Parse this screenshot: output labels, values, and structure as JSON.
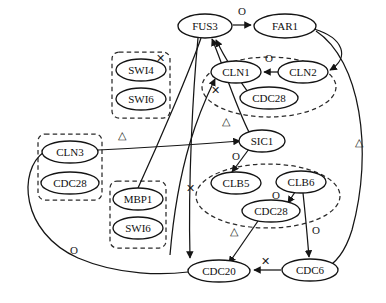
{
  "diagram": {
    "type": "directed-graph",
    "width": 386,
    "height": 303,
    "background": "#ffffff",
    "node_fill": "#ffffff",
    "node_stroke": "#141414",
    "group_stroke": "#2a2a2a",
    "edge_stroke": "#151515"
  },
  "nodes": [
    {
      "id": "FUS3",
      "label": "FUS3",
      "cx": 205,
      "cy": 26,
      "rx": 27,
      "ry": 12
    },
    {
      "id": "FAR1",
      "label": "FAR1",
      "cx": 285,
      "cy": 26,
      "rx": 31,
      "ry": 12
    },
    {
      "id": "SWI4",
      "label": "SWI4",
      "cx": 141,
      "cy": 70,
      "rx": 25,
      "ry": 11
    },
    {
      "id": "SWI6a",
      "label": "SWI6",
      "cx": 141,
      "cy": 99,
      "rx": 25,
      "ry": 11
    },
    {
      "id": "CLN1",
      "label": "CLN1",
      "cx": 236,
      "cy": 72,
      "rx": 25,
      "ry": 11
    },
    {
      "id": "CLN2",
      "label": "CLN2",
      "cx": 303,
      "cy": 72,
      "rx": 25,
      "ry": 11
    },
    {
      "id": "CDC28a",
      "label": "CDC28",
      "cx": 269,
      "cy": 98,
      "rx": 29,
      "ry": 11
    },
    {
      "id": "CLN3",
      "label": "CLN3",
      "cx": 70,
      "cy": 152,
      "rx": 28,
      "ry": 11
    },
    {
      "id": "CDC28b",
      "label": "CDC28",
      "cx": 70,
      "cy": 183,
      "rx": 29,
      "ry": 11
    },
    {
      "id": "MBP1",
      "label": "MBP1",
      "cx": 138,
      "cy": 199,
      "rx": 25,
      "ry": 11
    },
    {
      "id": "SWI6b",
      "label": "SWI6",
      "cx": 138,
      "cy": 228,
      "rx": 25,
      "ry": 11
    },
    {
      "id": "SIC1",
      "label": "SIC1",
      "cx": 262,
      "cy": 141,
      "rx": 23,
      "ry": 11
    },
    {
      "id": "CLB5",
      "label": "CLB5",
      "cx": 236,
      "cy": 183,
      "rx": 25,
      "ry": 11
    },
    {
      "id": "CLB6",
      "label": "CLB6",
      "cx": 301,
      "cy": 182,
      "rx": 25,
      "ry": 11
    },
    {
      "id": "CDC28c",
      "label": "CDC28",
      "cx": 271,
      "cy": 211,
      "rx": 29,
      "ry": 11
    },
    {
      "id": "CDC20",
      "label": "CDC20",
      "cx": 219,
      "cy": 271,
      "rx": 31,
      "ry": 11
    },
    {
      "id": "CDC6",
      "label": "CDC6",
      "cx": 310,
      "cy": 270,
      "rx": 28,
      "ry": 11
    }
  ],
  "groups": [
    {
      "id": "g-swi",
      "shape": "box",
      "label": "SWI4-SWI6 complex",
      "x": 112,
      "y": 52,
      "w": 58,
      "h": 66
    },
    {
      "id": "g-cln",
      "shape": "ellipse",
      "label": "CLN1-CLN2-CDC28",
      "cx": 269,
      "cy": 87,
      "rx": 67,
      "ry": 30
    },
    {
      "id": "g-cln3",
      "shape": "box",
      "label": "CLN3-CDC28 complex",
      "x": 38,
      "y": 134,
      "w": 64,
      "h": 66
    },
    {
      "id": "g-mbp",
      "shape": "box",
      "label": "MBP1-SWI6 complex",
      "x": 110,
      "y": 181,
      "w": 56,
      "h": 67
    },
    {
      "id": "g-clb",
      "shape": "ellipse",
      "label": "CLB5-CLB6-CDC28",
      "cx": 268,
      "cy": 196,
      "rx": 72,
      "ry": 32
    }
  ],
  "edges": [
    {
      "from": "FUS3",
      "to": "FAR1",
      "label": "O",
      "label_x": 242,
      "label_y": 12
    },
    {
      "from": "CLN2",
      "to": "CLN1",
      "label": "O",
      "label_x": 269,
      "label_y": 59
    },
    {
      "from": "SIC1",
      "to": "CLB5",
      "label": "O",
      "label_x": 236,
      "label_y": 157
    },
    {
      "from": "CLB6",
      "to": "CDC28c",
      "label": "O",
      "label_x": 276,
      "label_y": 196
    },
    {
      "from": "CLB6",
      "to": "CDC6",
      "label": "O",
      "label_x": 316,
      "label_y": 231
    },
    {
      "from": "CLN3",
      "to": "CDC20",
      "label": "O",
      "label_x": 74,
      "label_y": 251
    },
    {
      "from": "CLN1",
      "to": "FUS3",
      "label": "X",
      "label_x": 160,
      "label_y": 59
    },
    {
      "from": "CDC28a",
      "to": "FUS3",
      "label": "X",
      "label_x": 215,
      "label_y": 91
    },
    {
      "from": "MBP1",
      "to": "CDC20",
      "label": "X",
      "label_x": 190,
      "label_y": 189
    },
    {
      "from": "CDC6",
      "to": "CDC20",
      "label": "X",
      "label_x": 265,
      "label_y": 262
    },
    {
      "from": "CLN3",
      "to": "SIC1",
      "label": "T",
      "label_x": 122,
      "label_y": 136
    },
    {
      "from": "SIC1",
      "to": "FUS3",
      "label": "T",
      "label_x": 226,
      "label_y": 122
    },
    {
      "from": "CDC28c",
      "to": "CDC20",
      "label": "T",
      "label_x": 234,
      "label_y": 232
    },
    {
      "from": "FAR1",
      "to": "CDC6",
      "label": "T",
      "label_x": 359,
      "label_y": 143
    }
  ],
  "edge_label_glyphs": {
    "O": "O",
    "X": "✕",
    "T": "△"
  }
}
